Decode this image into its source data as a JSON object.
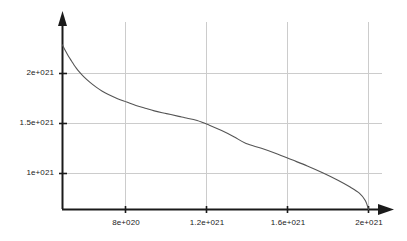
{
  "chart_data": {
    "type": "line",
    "title": "",
    "subtitle": "",
    "xlabel": "",
    "ylabel": "",
    "grid": true,
    "legend": null,
    "legend_position": "none",
    "xlim": [
      0,
      2.1e+21
    ],
    "ylim": [
      0,
      2.55e+21
    ],
    "xticks": [
      8e+20,
      1.2e+21,
      1.6e+21,
      2e+21
    ],
    "xtick_labels": [
      "8e+020",
      "1.2e+021",
      "1.6e+021",
      "2e+021"
    ],
    "yticks": [
      1e+21,
      1.5e+21,
      2e+21
    ],
    "ytick_labels": [
      "1e+021",
      "1.5e+021",
      "2e+021"
    ],
    "axis_arrows": true,
    "series": [
      {
        "name": "curve",
        "color": "#555555",
        "x": [
          0.0,
          2e+19,
          4e+19,
          6e+19,
          8e+19,
          1e+20,
          1.4e+20,
          1.8e+20,
          2.2e+20,
          2.6e+20,
          3e+20,
          3.6e+20,
          4.2e+20,
          4.8e+20,
          5.4e+20,
          6e+20,
          6.8e+20,
          7.6e+20,
          8e+20,
          8.8e+20,
          9.6e+20,
          1.04e+21,
          1.12e+21,
          1.2e+21,
          1.3e+21,
          1.4e+21,
          1.5e+21,
          1.6e+21,
          1.7e+21,
          1.8e+21,
          1.88e+21,
          1.94e+21,
          1.98e+21,
          2e+21
        ],
        "y": [
          2.42e+21,
          2.33e+21,
          2.25e+21,
          2.18e+21,
          2.11e+21,
          2.05e+21,
          1.95e+21,
          1.87e+21,
          1.8e+21,
          1.74e+21,
          1.69e+21,
          1.63e+21,
          1.58e+21,
          1.53e+21,
          1.49e+21,
          1.45e+21,
          1.41e+21,
          1.37e+21,
          1.5e+21,
          1.31e+21,
          1.24e+21,
          1.16e+21,
          1.07e+21,
          9.7e+20,
          9e+20,
          8.2e+20,
          7.3e+20,
          6.4e+20,
          5.4e+20,
          4.3e+20,
          3.3e+20,
          2.4e+20,
          1.3e+20,
          0.0
        ]
      }
    ]
  },
  "axes": {
    "x_axis_name": "x-axis",
    "y_axis_name": "y-axis",
    "axis_color": "#1a1a1a",
    "grid_color": "#cccccc",
    "curve_color": "#555555"
  }
}
